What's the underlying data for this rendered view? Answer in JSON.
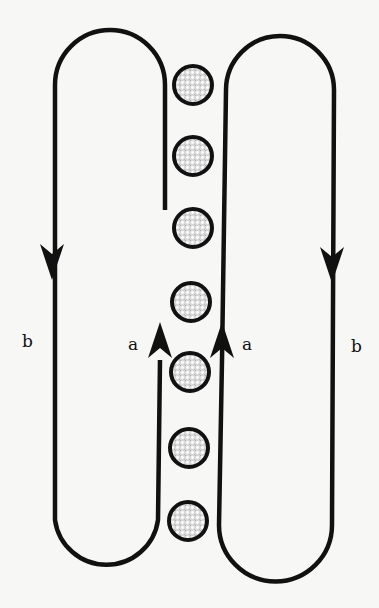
{
  "diagram": {
    "colors": {
      "line": "#111111",
      "background": "#f7f7f5",
      "particle_fill": "#e8e8e8"
    },
    "loops": [
      {
        "name": "left-loop",
        "path": "M 165 210 L 165 85 A 55 55 0 0 0 55 85 L 55 520 A 52 52 0 0 0 158 520 L 160 360"
      },
      {
        "name": "right-loop",
        "path": "M 222 360 L 226 90 A 54 54 0 0 1 334 90 L 332 525 A 56 56 0 0 1 219 525 L 222 360"
      }
    ],
    "arrows": [
      {
        "name": "arrow-left-outer-down",
        "direction": "down",
        "x": 52,
        "tip_y": 280
      },
      {
        "name": "arrow-left-inner-up",
        "direction": "up",
        "x": 160,
        "tip_y": 322
      },
      {
        "name": "arrow-right-inner-up",
        "direction": "up",
        "x": 222,
        "tip_y": 322
      },
      {
        "name": "arrow-right-outer-down",
        "direction": "down",
        "x": 332,
        "tip_y": 283
      }
    ],
    "labels": [
      {
        "name": "label-b-left",
        "text": "b",
        "x": 22,
        "y": 347
      },
      {
        "name": "label-a-left",
        "text": "a",
        "x": 128,
        "y": 350
      },
      {
        "name": "label-a-right",
        "text": "a",
        "x": 242,
        "y": 350
      },
      {
        "name": "label-b-right",
        "text": "b",
        "x": 351,
        "y": 352
      }
    ],
    "particles": [
      {
        "cx": 193,
        "cy": 85,
        "r": 19
      },
      {
        "cx": 193,
        "cy": 156,
        "r": 19
      },
      {
        "cx": 193,
        "cy": 228,
        "r": 19
      },
      {
        "cx": 191,
        "cy": 302,
        "r": 19
      },
      {
        "cx": 190,
        "cy": 372,
        "r": 19
      },
      {
        "cx": 189,
        "cy": 448,
        "r": 19
      },
      {
        "cx": 188,
        "cy": 521,
        "r": 19
      }
    ]
  }
}
